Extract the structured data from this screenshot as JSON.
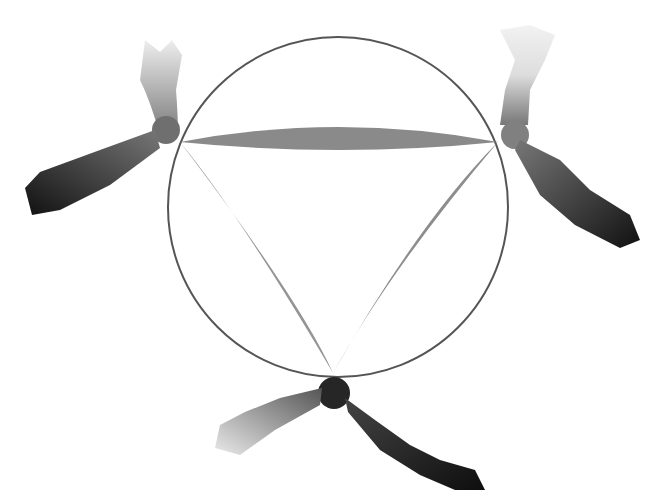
{
  "figure": {
    "background": "#ffffff",
    "circle": {
      "cx": 338,
      "cy": 207,
      "r": 170,
      "stroke": "#555555"
    },
    "vertices": [
      {
        "name": "top-left",
        "x": 180,
        "y": 142
      },
      {
        "name": "top-right",
        "x": 498,
        "y": 142
      },
      {
        "name": "bottom",
        "x": 333,
        "y": 373
      }
    ],
    "leaf_color": "#8a8a8a",
    "arm_colors": {
      "light": "#e6e6e6",
      "mid": "#8c8c8c",
      "dark": "#1a1a1a"
    }
  }
}
